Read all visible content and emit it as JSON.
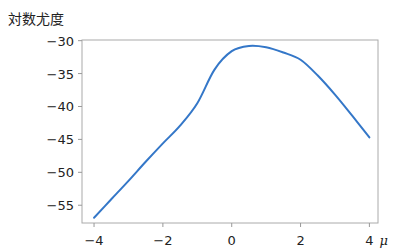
{
  "chart_data": {
    "type": "line",
    "title": "",
    "xlabel": "μ",
    "ylabel": "対数尤度",
    "xlim": [
      -4.35,
      4.25
    ],
    "ylim": [
      -57.7,
      -29.9
    ],
    "grid": false,
    "legend": null,
    "xticks": [
      -4,
      -2,
      0,
      2,
      4
    ],
    "xtick_labels": [
      "−4",
      "−2",
      "0",
      "2",
      "4"
    ],
    "yticks": [
      -30,
      -35,
      -40,
      -45,
      -50,
      -55
    ],
    "ytick_labels": [
      "−30",
      "−35",
      "−40",
      "−45",
      "−50",
      "−55"
    ],
    "series": [
      {
        "name": "log-likelihood",
        "color": "#3477c8",
        "x": [
          -4,
          -3.5,
          -3,
          -2.5,
          -2,
          -1.5,
          -1,
          -0.5,
          0,
          0.5,
          1,
          1.5,
          2,
          2.5,
          3,
          3.5,
          4
        ],
        "y": [
          -56.9,
          -54.1,
          -51.3,
          -48.4,
          -45.6,
          -42.9,
          -39.5,
          -34.4,
          -31.6,
          -30.8,
          -31.0,
          -31.8,
          -32.9,
          -35.3,
          -38.2,
          -41.4,
          -44.7
        ]
      }
    ]
  },
  "labels": {
    "ylabel": "対数尤度",
    "xlabel": "μ"
  }
}
